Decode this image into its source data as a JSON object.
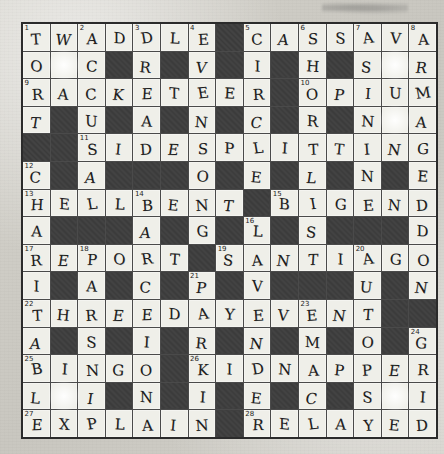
{
  "page": {
    "rows": 15,
    "cols": 15,
    "ink_color": "#1d1d1d",
    "block_color": "#3b3b3b",
    "cell_color": "#efefe9",
    "paper_color": "#cfcdc6"
  },
  "grid": {
    "rows": [
      [
        {
          "t": "w",
          "n": "1",
          "l": "T"
        },
        {
          "t": "w",
          "l": "W"
        },
        {
          "t": "w",
          "n": "2",
          "l": "A"
        },
        {
          "t": "w",
          "l": "D"
        },
        {
          "t": "w",
          "n": "3",
          "l": "D"
        },
        {
          "t": "w",
          "l": "L"
        },
        {
          "t": "w",
          "n": "4",
          "l": "E"
        },
        {
          "t": "b"
        },
        {
          "t": "w",
          "n": "5",
          "l": "C"
        },
        {
          "t": "w",
          "l": "A"
        },
        {
          "t": "w",
          "n": "6",
          "l": "S"
        },
        {
          "t": "w",
          "l": "S"
        },
        {
          "t": "w",
          "n": "7",
          "l": "A"
        },
        {
          "t": "w",
          "l": "V"
        },
        {
          "t": "w",
          "n": "8",
          "l": "A"
        }
      ],
      [
        {
          "t": "w",
          "l": "O"
        },
        {
          "t": "w",
          "l": "",
          "blot": true
        },
        {
          "t": "w",
          "l": "C"
        },
        {
          "t": "b"
        },
        {
          "t": "w",
          "l": "R"
        },
        {
          "t": "b"
        },
        {
          "t": "w",
          "l": "V"
        },
        {
          "t": "b"
        },
        {
          "t": "w",
          "l": "I"
        },
        {
          "t": "b"
        },
        {
          "t": "w",
          "l": "H"
        },
        {
          "t": "b"
        },
        {
          "t": "w",
          "l": "S"
        },
        {
          "t": "w",
          "l": "",
          "blot": true
        },
        {
          "t": "w",
          "l": "R"
        }
      ],
      [
        {
          "t": "w",
          "n": "9",
          "l": "R"
        },
        {
          "t": "w",
          "l": "A"
        },
        {
          "t": "w",
          "l": "C"
        },
        {
          "t": "w",
          "l": "K"
        },
        {
          "t": "w",
          "l": "E"
        },
        {
          "t": "w",
          "l": "T"
        },
        {
          "t": "w",
          "l": "E"
        },
        {
          "t": "w",
          "l": "E"
        },
        {
          "t": "w",
          "l": "R"
        },
        {
          "t": "b"
        },
        {
          "t": "w",
          "n": "10",
          "l": "O"
        },
        {
          "t": "w",
          "l": "P"
        },
        {
          "t": "w",
          "l": "I"
        },
        {
          "t": "w",
          "l": "U"
        },
        {
          "t": "w",
          "l": "M"
        }
      ],
      [
        {
          "t": "w",
          "l": "T"
        },
        {
          "t": "b"
        },
        {
          "t": "w",
          "l": "U"
        },
        {
          "t": "b"
        },
        {
          "t": "w",
          "l": "A"
        },
        {
          "t": "b"
        },
        {
          "t": "w",
          "l": "N"
        },
        {
          "t": "b"
        },
        {
          "t": "w",
          "l": "C"
        },
        {
          "t": "b"
        },
        {
          "t": "w",
          "l": "R"
        },
        {
          "t": "b"
        },
        {
          "t": "w",
          "l": "N"
        },
        {
          "t": "w",
          "l": "",
          "blot": true
        },
        {
          "t": "w",
          "l": "A"
        }
      ],
      [
        {
          "t": "b"
        },
        {
          "t": "b"
        },
        {
          "t": "w",
          "n": "11",
          "l": "S"
        },
        {
          "t": "w",
          "l": "I"
        },
        {
          "t": "w",
          "l": "D"
        },
        {
          "t": "w",
          "l": "E"
        },
        {
          "t": "w",
          "l": "S"
        },
        {
          "t": "w",
          "l": "P"
        },
        {
          "t": "w",
          "l": "L"
        },
        {
          "t": "w",
          "l": "I"
        },
        {
          "t": "w",
          "l": "T"
        },
        {
          "t": "w",
          "l": "T"
        },
        {
          "t": "w",
          "l": "I"
        },
        {
          "t": "w",
          "l": "N"
        },
        {
          "t": "w",
          "l": "G"
        }
      ],
      [
        {
          "t": "w",
          "n": "12",
          "l": "C"
        },
        {
          "t": "b"
        },
        {
          "t": "w",
          "l": "A"
        },
        {
          "t": "b"
        },
        {
          "t": "b"
        },
        {
          "t": "b"
        },
        {
          "t": "w",
          "l": "O"
        },
        {
          "t": "b"
        },
        {
          "t": "w",
          "l": "E"
        },
        {
          "t": "b"
        },
        {
          "t": "w",
          "l": "L"
        },
        {
          "t": "b"
        },
        {
          "t": "w",
          "l": "N"
        },
        {
          "t": "b"
        },
        {
          "t": "w",
          "l": "E"
        }
      ],
      [
        {
          "t": "w",
          "n": "13",
          "l": "H"
        },
        {
          "t": "w",
          "l": "E"
        },
        {
          "t": "w",
          "l": "L"
        },
        {
          "t": "w",
          "l": "L"
        },
        {
          "t": "w",
          "n": "14",
          "l": "B"
        },
        {
          "t": "w",
          "l": "E"
        },
        {
          "t": "w",
          "l": "N"
        },
        {
          "t": "w",
          "l": "T"
        },
        {
          "t": "b"
        },
        {
          "t": "w",
          "n": "15",
          "l": "B"
        },
        {
          "t": "w",
          "l": "I"
        },
        {
          "t": "w",
          "l": "G"
        },
        {
          "t": "w",
          "l": "E"
        },
        {
          "t": "w",
          "l": "N"
        },
        {
          "t": "w",
          "l": "D"
        }
      ],
      [
        {
          "t": "w",
          "l": "A"
        },
        {
          "t": "b"
        },
        {
          "t": "b"
        },
        {
          "t": "b"
        },
        {
          "t": "w",
          "l": "A"
        },
        {
          "t": "b"
        },
        {
          "t": "w",
          "l": "G"
        },
        {
          "t": "b"
        },
        {
          "t": "w",
          "n": "16",
          "l": "L"
        },
        {
          "t": "b"
        },
        {
          "t": "w",
          "l": "S"
        },
        {
          "t": "b"
        },
        {
          "t": "b"
        },
        {
          "t": "b"
        },
        {
          "t": "w",
          "l": "D"
        }
      ],
      [
        {
          "t": "w",
          "n": "17",
          "l": "R"
        },
        {
          "t": "w",
          "l": "E"
        },
        {
          "t": "w",
          "n": "18",
          "l": "P"
        },
        {
          "t": "w",
          "l": "O"
        },
        {
          "t": "w",
          "l": "R"
        },
        {
          "t": "w",
          "l": "T"
        },
        {
          "t": "b"
        },
        {
          "t": "w",
          "n": "19",
          "l": "S"
        },
        {
          "t": "w",
          "l": "A"
        },
        {
          "t": "w",
          "l": "N"
        },
        {
          "t": "w",
          "l": "T"
        },
        {
          "t": "w",
          "l": "I"
        },
        {
          "t": "w",
          "n": "20",
          "l": "A"
        },
        {
          "t": "w",
          "l": "G"
        },
        {
          "t": "w",
          "l": "O"
        }
      ],
      [
        {
          "t": "w",
          "l": "I"
        },
        {
          "t": "b"
        },
        {
          "t": "w",
          "l": "A"
        },
        {
          "t": "b"
        },
        {
          "t": "w",
          "l": "C"
        },
        {
          "t": "b"
        },
        {
          "t": "w",
          "n": "21",
          "l": "P"
        },
        {
          "t": "b"
        },
        {
          "t": "w",
          "l": "V"
        },
        {
          "t": "b"
        },
        {
          "t": "b"
        },
        {
          "t": "b"
        },
        {
          "t": "w",
          "l": "U"
        },
        {
          "t": "b"
        },
        {
          "t": "w",
          "l": "N"
        }
      ],
      [
        {
          "t": "w",
          "n": "22",
          "l": "T"
        },
        {
          "t": "w",
          "l": "H"
        },
        {
          "t": "w",
          "l": "R"
        },
        {
          "t": "w",
          "l": "E"
        },
        {
          "t": "w",
          "l": "E"
        },
        {
          "t": "w",
          "l": "D"
        },
        {
          "t": "w",
          "l": "A"
        },
        {
          "t": "w",
          "l": "Y"
        },
        {
          "t": "w",
          "l": "E"
        },
        {
          "t": "w",
          "l": "V"
        },
        {
          "t": "w",
          "n": "23",
          "l": "E"
        },
        {
          "t": "w",
          "l": "N"
        },
        {
          "t": "w",
          "l": "T"
        },
        {
          "t": "b"
        },
        {
          "t": "b"
        }
      ],
      [
        {
          "t": "w",
          "l": "A"
        },
        {
          "t": "b"
        },
        {
          "t": "w",
          "l": "S"
        },
        {
          "t": "b"
        },
        {
          "t": "w",
          "l": "I"
        },
        {
          "t": "b"
        },
        {
          "t": "w",
          "l": "R"
        },
        {
          "t": "b"
        },
        {
          "t": "w",
          "l": "N"
        },
        {
          "t": "b"
        },
        {
          "t": "w",
          "l": "M"
        },
        {
          "t": "b"
        },
        {
          "t": "w",
          "l": "O"
        },
        {
          "t": "b"
        },
        {
          "t": "w",
          "n": "24",
          "l": "G"
        }
      ],
      [
        {
          "t": "w",
          "n": "25",
          "l": "B"
        },
        {
          "t": "w",
          "l": "I"
        },
        {
          "t": "w",
          "l": "N"
        },
        {
          "t": "w",
          "l": "G"
        },
        {
          "t": "w",
          "l": "O"
        },
        {
          "t": "b"
        },
        {
          "t": "w",
          "n": "26",
          "l": "K"
        },
        {
          "t": "w",
          "l": "I"
        },
        {
          "t": "w",
          "l": "D"
        },
        {
          "t": "w",
          "l": "N"
        },
        {
          "t": "w",
          "l": "A"
        },
        {
          "t": "w",
          "l": "P"
        },
        {
          "t": "w",
          "l": "P"
        },
        {
          "t": "w",
          "l": "E"
        },
        {
          "t": "w",
          "l": "R"
        }
      ],
      [
        {
          "t": "w",
          "l": "L"
        },
        {
          "t": "w",
          "l": "",
          "blot": true
        },
        {
          "t": "w",
          "l": "I"
        },
        {
          "t": "b"
        },
        {
          "t": "w",
          "l": "N"
        },
        {
          "t": "b"
        },
        {
          "t": "w",
          "l": "I"
        },
        {
          "t": "b"
        },
        {
          "t": "w",
          "l": "E"
        },
        {
          "t": "b"
        },
        {
          "t": "w",
          "l": "C"
        },
        {
          "t": "b"
        },
        {
          "t": "w",
          "l": "S"
        },
        {
          "t": "w",
          "l": "",
          "blot": true
        },
        {
          "t": "w",
          "l": "I"
        }
      ],
      [
        {
          "t": "w",
          "n": "27",
          "l": "E"
        },
        {
          "t": "w",
          "l": "X"
        },
        {
          "t": "w",
          "l": "P"
        },
        {
          "t": "w",
          "l": "L"
        },
        {
          "t": "w",
          "l": "A"
        },
        {
          "t": "w",
          "l": "I"
        },
        {
          "t": "w",
          "l": "N"
        },
        {
          "t": "b"
        },
        {
          "t": "w",
          "n": "28",
          "l": "R"
        },
        {
          "t": "w",
          "l": "E"
        },
        {
          "t": "w",
          "l": "L"
        },
        {
          "t": "w",
          "l": "A"
        },
        {
          "t": "w",
          "l": "Y"
        },
        {
          "t": "w",
          "l": "E"
        },
        {
          "t": "w",
          "l": "D"
        }
      ]
    ]
  }
}
